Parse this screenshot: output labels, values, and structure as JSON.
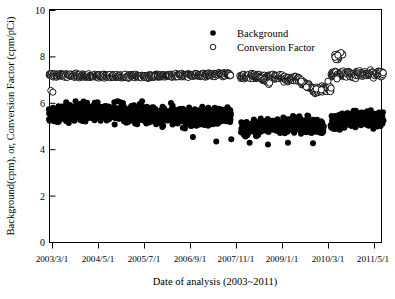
{
  "chart_data": {
    "type": "scatter",
    "title": "",
    "xlabel": "Date of analysis (2003~2011)",
    "ylabel": "Background(cpm), or, Conversion Factor (cpm/pCi)",
    "ylim": [
      0,
      10
    ],
    "yticks": [
      0,
      2,
      4,
      6,
      8,
      10
    ],
    "ytick_labels": [
      "0",
      "2",
      "4",
      "6",
      "8",
      "10"
    ],
    "xtick_labels": [
      "2003/3/1",
      "2004/5/1",
      "2005/7/1",
      "2006/9/1",
      "2007/11/1",
      "2009/1/1",
      "2010/3/1",
      "2011/5/1"
    ],
    "xlim_labels": [
      "2003/3/1",
      "2011/5/1"
    ],
    "grid": false,
    "legend_position": "top-center-right",
    "marker_colors": {
      "background": "#000000",
      "conversion_factor_face": "#ffffff",
      "conversion_factor_edge": "#000000"
    },
    "series": [
      {
        "name": "Background",
        "marker": "filled-circle",
        "unit": "cpm",
        "approx_range": [
          4.2,
          6.3
        ],
        "segments": [
          {
            "x_start": "2003/3/1",
            "x_end": "2007/9/1",
            "mean": 5.5,
            "spread": 0.55
          },
          {
            "x_start": "2007/10/1",
            "x_end": "2010/2/1",
            "mean": 4.75,
            "spread": 0.45
          },
          {
            "x_start": "2010/3/1",
            "x_end": "2011/5/1",
            "mean": 5.2,
            "spread": 0.5
          }
        ]
      },
      {
        "name": "Conversion Factor",
        "marker": "open-circle",
        "unit": "cpm/pCi",
        "approx_range": [
          6.4,
          8.3
        ],
        "segments": [
          {
            "x_start": "2003/3/1",
            "x_end": "2007/9/1",
            "mean": 7.2,
            "spread": 0.12
          },
          {
            "x_start": "2007/10/1",
            "x_end": "2010/2/1",
            "mean": 7.1,
            "spread": 0.15
          },
          {
            "x_start": "2010/3/1",
            "x_end": "2011/5/1",
            "mean": 7.2,
            "spread": 0.25
          }
        ]
      }
    ],
    "legend": [
      {
        "label": "Background",
        "marker": "filled-circle"
      },
      {
        "label": "Conversion Factor",
        "marker": "open-circle"
      }
    ]
  },
  "axes": {
    "y_title": "Background(cpm), or, Conversion Factor (cpm/pCi)",
    "x_title": "Date of analysis (2003~2011)",
    "y_tick_0": "0",
    "y_tick_1": "2",
    "y_tick_2": "4",
    "y_tick_3": "6",
    "y_tick_4": "8",
    "y_tick_5": "10",
    "x_tick_0": "2003/3/1",
    "x_tick_1": "2004/5/1",
    "x_tick_2": "2005/7/1",
    "x_tick_3": "2006/9/1",
    "x_tick_4": "2007/11/1",
    "x_tick_5": "2009/1/1",
    "x_tick_6": "2010/3/1",
    "x_tick_7": "2011/5/1"
  },
  "legend": {
    "item_0_label": "Background",
    "item_1_label": "Conversion Factor"
  }
}
